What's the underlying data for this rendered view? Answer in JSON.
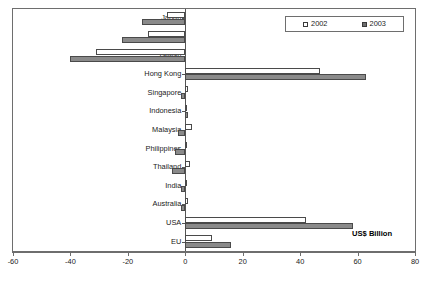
{
  "chart_data": {
    "type": "bar",
    "orientation": "horizontal",
    "title": "",
    "subtitle": "",
    "xlabel": "US$ Billion",
    "ylabel": "",
    "xlim": [
      -60,
      80
    ],
    "xticks": [
      -60,
      -40,
      -20,
      0,
      20,
      40,
      60,
      80
    ],
    "xtick_labels": [
      "-60",
      "-40",
      "-20",
      "0",
      "20",
      "40",
      "60",
      "80"
    ],
    "grid": false,
    "legend_position": "top-right",
    "categories": [
      "Japan",
      "Korea",
      "Taiwan",
      "Hong Kong",
      "Singapore",
      "Indonesia",
      "Malaysia",
      "Philippines",
      "Thailand",
      "India",
      "Australia",
      "USA",
      "EU"
    ],
    "series": [
      {
        "name": "2002",
        "color": "#ffffff",
        "values": [
          -6.5,
          -13.0,
          -31.0,
          47.0,
          0.8,
          0.7,
          2.5,
          0.5,
          1.5,
          0.7,
          1.0,
          42.0,
          9.3
        ]
      },
      {
        "name": "2003",
        "color": "#8a8a8a",
        "values": [
          -15.0,
          -22.0,
          -40.0,
          63.0,
          -1.5,
          1.0,
          -2.5,
          -3.5,
          -4.5,
          -1.5,
          -1.5,
          58.5,
          16.0
        ]
      }
    ],
    "annotations": [
      {
        "text": "US$ Billion",
        "name": "units-label"
      }
    ]
  },
  "legend": {
    "entries": [
      {
        "label": "2002",
        "swatch": "hollow-square-icon"
      },
      {
        "label": "2003",
        "swatch": "filled-square-icon"
      }
    ]
  },
  "axis": {
    "units_note": "US$ Billion"
  }
}
